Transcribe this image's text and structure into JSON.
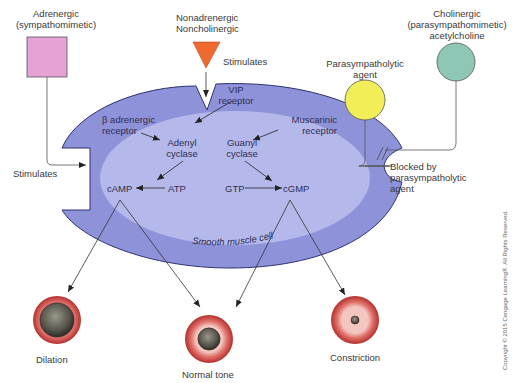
{
  "agents": {
    "adrenergic": {
      "line1": "Adrenergic",
      "line2": "(sympathomimetic)",
      "color": "#e6a2d4"
    },
    "nanc": {
      "line1": "Nonadrenergic",
      "line2": "Noncholinergic",
      "color": "#ee6a30"
    },
    "parasympatholytic": {
      "line1": "Parasympatholytic",
      "line2": "agent",
      "color": "#f2ee58"
    },
    "cholinergic": {
      "line1": "Cholinergic",
      "line2": "(parasympathomimetic)",
      "line3": "acetylcholine",
      "color": "#8ec7b6"
    }
  },
  "cell": {
    "label": "Smooth muscle cell",
    "outer_color": "#8e92d8",
    "inner_color": "#b5b8ea",
    "receptors": {
      "vip": {
        "line1": "VIP",
        "line2": "receptor"
      },
      "beta": {
        "line1": "β adrenergic",
        "line2": "receptor"
      },
      "muscarinic": {
        "line1": "Muscarinic",
        "line2": "receptor"
      }
    },
    "enzymes": {
      "adenyl": {
        "line1": "Adenyl",
        "line2": "cyclase"
      },
      "guanyl": {
        "line1": "Guanyl",
        "line2": "cyclase"
      }
    },
    "molecules": {
      "camp": "cAMP",
      "atp": "ATP",
      "gtp": "GTP",
      "cgmp": "cGMP"
    }
  },
  "annotations": {
    "stimulates_top": "Stimulates",
    "stimulates_left": "Stimulates",
    "blocked": {
      "line1": "Blocked by",
      "line2": "parasympatholytic",
      "line3": "agent"
    }
  },
  "outcomes": {
    "dilation": "Dilation",
    "normal": "Normal tone",
    "constriction": "Constriction"
  },
  "copyright": "Copyright © 2015 Cengage Learning®. All Rights Reserved."
}
